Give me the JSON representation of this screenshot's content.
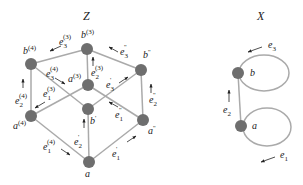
{
  "colors": {
    "edge": "#aaaaaa",
    "node": "#6e6e6e",
    "text": "#222222"
  },
  "graph_Z": {
    "title": "Z",
    "nodes": [
      {
        "id": "b3",
        "label": "b",
        "sup": "(3)"
      },
      {
        "id": "b4",
        "label": "b",
        "sup": "(4)"
      },
      {
        "id": "bpp",
        "label": "b",
        "sup": "''"
      },
      {
        "id": "a3",
        "label": "a",
        "sup": "(3)"
      },
      {
        "id": "bp",
        "label": "b",
        "sup": "'"
      },
      {
        "id": "a4",
        "label": "a",
        "sup": "(4)"
      },
      {
        "id": "app",
        "label": "a",
        "sup": "''"
      },
      {
        "id": "a",
        "label": "a",
        "sup": ""
      }
    ],
    "edge_labels": [
      {
        "label": "e",
        "sub": "3",
        "sup": "(3)"
      },
      {
        "label": "e",
        "sub": "3",
        "sup": "''"
      },
      {
        "label": "e",
        "sub": "3",
        "sup": "(4)"
      },
      {
        "label": "e",
        "sub": "2",
        "sup": "(3)"
      },
      {
        "label": "e",
        "sub": "3",
        "sup": "'"
      },
      {
        "label": "e",
        "sub": "1",
        "sup": "(3)"
      },
      {
        "label": "e",
        "sub": "2",
        "sup": "(4)"
      },
      {
        "label": "e",
        "sub": "2",
        "sup": "''"
      },
      {
        "label": "e",
        "sub": "1",
        "sup": "''"
      },
      {
        "label": "e",
        "sub": "2",
        "sup": "'"
      },
      {
        "label": "e",
        "sub": "1",
        "sup": "(4)"
      },
      {
        "label": "e",
        "sub": "1",
        "sup": "'"
      }
    ]
  },
  "graph_X": {
    "title": "X",
    "nodes": [
      {
        "id": "b",
        "label": "b"
      },
      {
        "id": "a",
        "label": "a"
      }
    ],
    "edge_labels": [
      {
        "label": "e",
        "sub": "3"
      },
      {
        "label": "e",
        "sub": "2"
      },
      {
        "label": "e",
        "sub": "1"
      }
    ]
  }
}
